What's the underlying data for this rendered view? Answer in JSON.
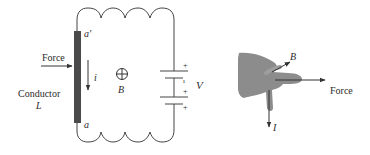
{
  "figure": {
    "circuit": {
      "force_label": "Force",
      "current_label": "i",
      "field_label": "B",
      "field_symbol": "⊕",
      "conductor_label": "Conductor",
      "length_label": "L",
      "top_end_label": "a′",
      "bottom_end_label": "a",
      "voltage_label": "V",
      "battery_plus_top": "+",
      "battery_minus": "ı",
      "battery_plus_mid": "+",
      "battery_plus_bottom": "+"
    },
    "right_hand_rule": {
      "field_label": "B",
      "force_label": "Force",
      "current_label": "I"
    },
    "colors": {
      "line": "#333333",
      "conductor": "#4a4a4a",
      "hand": "#8c8c8c"
    }
  }
}
